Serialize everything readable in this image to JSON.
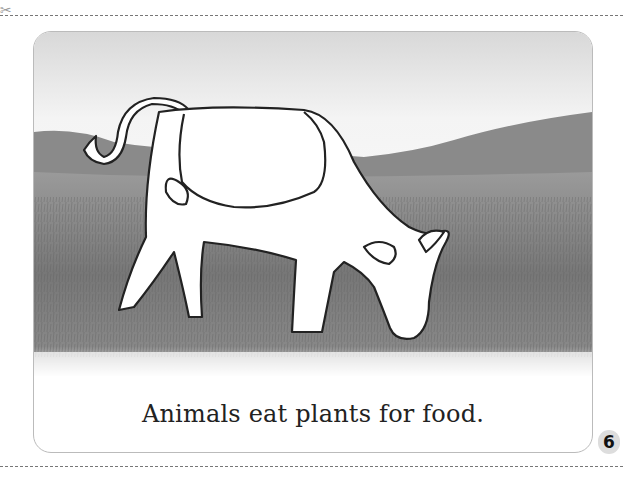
{
  "page": {
    "caption": "Animals eat plants for food.",
    "page_number": "6",
    "cut_marker_icon": "scissors-icon",
    "illustration": "cow-grazing-outline-on-grassland-photo"
  }
}
